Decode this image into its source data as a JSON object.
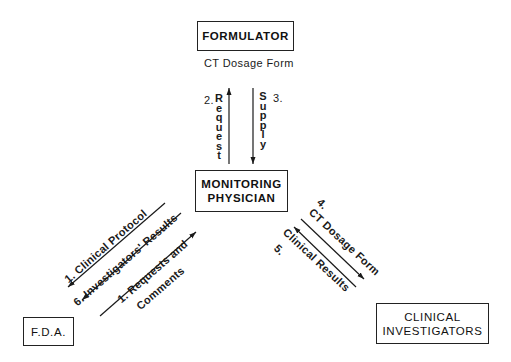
{
  "diagram": {
    "nodes": {
      "formulator": "FORMULATOR",
      "monitoring_physician_line1": "MONITORING",
      "monitoring_physician_line2": "PHYSICIAN",
      "fda": "F.D.A.",
      "clinical_investigators_line1": "CLINICAL",
      "clinical_investigators_line2": "INVESTIGATORS"
    },
    "labels": {
      "formulator_caption": "CT Dosage Form",
      "request_num": "2.",
      "request_letters": [
        "R",
        "e",
        "q",
        "u",
        "e",
        "s",
        "t"
      ],
      "supply_num": "3.",
      "supply_letters": [
        "S",
        "u",
        "p",
        "p",
        "l",
        "y"
      ],
      "clinical_protocol": "1. Clinical Protocol",
      "investigators_results": "6. Investigators' Results",
      "requests_and": "1. Requests and",
      "comments": "Comments",
      "ci_ct_dosage_num": "4.",
      "ci_ct_dosage": "CT Dosage Form",
      "ci_clinical_results_num": "5.",
      "ci_clinical_results": "Clinical Results"
    },
    "edges": [
      {
        "from": "monitoring_physician",
        "to": "formulator",
        "label": "2. Request"
      },
      {
        "from": "formulator",
        "to": "monitoring_physician",
        "label": "3. Supply"
      },
      {
        "from": "monitoring_physician",
        "to": "fda",
        "label": "1. Clinical Protocol"
      },
      {
        "from": "monitoring_physician",
        "to": "fda",
        "label": "6. Investigators' Results"
      },
      {
        "from": "fda",
        "to": "monitoring_physician",
        "label": "1. Requests and Comments"
      },
      {
        "from": "monitoring_physician",
        "to": "clinical_investigators",
        "label": "4. CT Dosage Form"
      },
      {
        "from": "clinical_investigators",
        "to": "monitoring_physician",
        "label": "5. Clinical Results"
      }
    ],
    "colors": {
      "ink": "#1a1a1a",
      "background": "#ffffff"
    }
  }
}
